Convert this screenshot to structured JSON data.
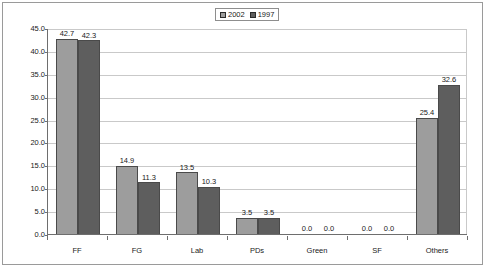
{
  "chart_data": {
    "type": "bar",
    "title": "",
    "subtitle": "",
    "xlabel": "",
    "ylabel": "",
    "categories": [
      "FF",
      "FG",
      "Lab",
      "PDs",
      "Green",
      "SF",
      "Others"
    ],
    "series": [
      {
        "name": "2002",
        "color": "#9d9d9d",
        "values": [
          42.7,
          14.9,
          13.5,
          3.5,
          0.0,
          0.0,
          25.4
        ]
      },
      {
        "name": "1997",
        "color": "#5e5e5e",
        "values": [
          42.3,
          11.3,
          10.3,
          3.5,
          0.0,
          0.0,
          32.6
        ]
      }
    ],
    "data_labels": [
      [
        "42.7",
        "42.3"
      ],
      [
        "14.9",
        "11.3"
      ],
      [
        "13.5",
        "10.3"
      ],
      [
        "3.5",
        "3.5"
      ],
      [
        "0.0",
        "0.0"
      ],
      [
        "0.0",
        "0.0"
      ],
      [
        "25.4",
        "32.6"
      ]
    ],
    "ylim": [
      0.0,
      45.0
    ],
    "ytick_step": 5.0,
    "ytick_labels": [
      "45.0",
      "40.0",
      "35.0",
      "30.0",
      "25.0",
      "20.0",
      "15.0",
      "10.0",
      "5.0",
      "0.0"
    ],
    "ytick_values": [
      45.0,
      40.0,
      35.0,
      30.0,
      25.0,
      20.0,
      15.0,
      10.0,
      5.0,
      0.0
    ],
    "grid": true,
    "grid_axis": "y",
    "legend_position": "top-center",
    "legend_entries": [
      "2002",
      "1997"
    ]
  },
  "legend": {
    "entries": [
      {
        "label": "2002",
        "swatch": "#9d9d9d"
      },
      {
        "label": "1997",
        "swatch": "#5e5e5e"
      }
    ]
  },
  "colors": {
    "series_2002": "#9d9d9d",
    "series_1997": "#5e5e5e",
    "gridline": "#c9c9c9",
    "axis": "#6e6e6e",
    "frame": "#9a9a9a",
    "text": "#1a1a1a",
    "background": "#ffffff"
  }
}
